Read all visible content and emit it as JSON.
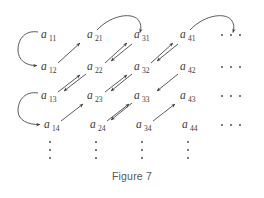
{
  "figure": {
    "caption": "Figure 7",
    "ink_color": "#3c3c3c",
    "background_color": "#ffffff",
    "grid": {
      "columns": 4,
      "rows": 4,
      "terms": [
        [
          {
            "base": "a",
            "sub": "11",
            "x": 41,
            "y": 38
          },
          {
            "base": "a",
            "sub": "21",
            "x": 87,
            "y": 38
          },
          {
            "base": "a",
            "sub": "31",
            "x": 134,
            "y": 38
          },
          {
            "base": "a",
            "sub": "41",
            "x": 180,
            "y": 38
          }
        ],
        [
          {
            "base": "a",
            "sub": "12",
            "x": 41,
            "y": 70
          },
          {
            "base": "a",
            "sub": "22",
            "x": 87,
            "y": 70
          },
          {
            "base": "a",
            "sub": "32",
            "x": 134,
            "y": 70
          },
          {
            "base": "a",
            "sub": "42",
            "x": 180,
            "y": 70
          }
        ],
        [
          {
            "base": "a",
            "sub": "13",
            "x": 41,
            "y": 99
          },
          {
            "base": "a",
            "sub": "23",
            "x": 87,
            "y": 99
          },
          {
            "base": "a",
            "sub": "33",
            "x": 134,
            "y": 99
          },
          {
            "base": "a",
            "sub": "43",
            "x": 180,
            "y": 99
          }
        ],
        [
          {
            "base": "a",
            "sub": "14",
            "x": 44,
            "y": 128
          },
          {
            "base": "a",
            "sub": "24",
            "x": 90,
            "y": 128
          },
          {
            "base": "a",
            "sub": "34",
            "x": 136,
            "y": 128
          },
          {
            "base": "a",
            "sub": "44",
            "x": 182,
            "y": 128
          }
        ]
      ]
    },
    "row_ellipses": [
      {
        "label": "horizontal-ellipsis-row-1",
        "y": 35
      },
      {
        "label": "horizontal-ellipsis-row-2",
        "y": 67
      },
      {
        "label": "horizontal-ellipsis-row-3",
        "y": 96
      },
      {
        "label": "horizontal-ellipsis-row-4",
        "y": 125
      }
    ],
    "column_ellipses": [
      {
        "label": "vertical-ellipsis-column-1",
        "x": 50
      },
      {
        "label": "vertical-ellipsis-column-2",
        "x": 96
      },
      {
        "label": "vertical-ellipsis-column-3",
        "x": 142
      },
      {
        "label": "vertical-ellipsis-column-4",
        "x": 188
      }
    ],
    "arrows": {
      "diagonal_up": [
        {
          "from": "a12",
          "to": "a21"
        },
        {
          "from": "a13",
          "to": "a22"
        },
        {
          "from": "a14",
          "to": "a23"
        },
        {
          "from": "a23",
          "to": "a32"
        },
        {
          "from": "a24",
          "to": "a33"
        },
        {
          "from": "a34",
          "to": "a43"
        },
        {
          "from": "a32",
          "to": "a41"
        },
        {
          "from": "a22",
          "to": "a31"
        }
      ],
      "diagonal_down": [
        {
          "from": "a31",
          "to": "a22"
        },
        {
          "from": "a21",
          "to": "a12"
        },
        {
          "from": "a41",
          "to": "a32"
        },
        {
          "from": "a42",
          "to": "a33"
        },
        {
          "from": "a33",
          "to": "a24"
        },
        {
          "from": "a43",
          "to": "a34"
        }
      ],
      "left_loops": [
        {
          "from": "a11",
          "to": "a12"
        },
        {
          "from": "a13",
          "to": "a14"
        }
      ],
      "top_arcs": [
        {
          "from": "a21",
          "to": "a31"
        },
        {
          "from": "a41",
          "to": "row-1-ellipsis"
        }
      ]
    }
  }
}
